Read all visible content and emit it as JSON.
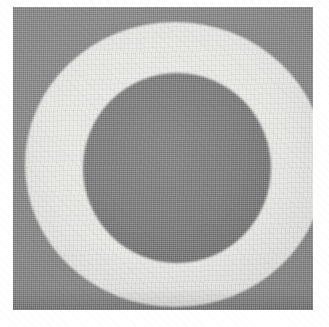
{
  "page": {
    "background_color": "#ffffff",
    "width": 329,
    "height": 327,
    "caption": ""
  },
  "image": {
    "kind": "scanned-halftone-photograph",
    "subject": "concentric-ring",
    "description": "Grayscale halftoned scan of a bright annulus (ring) surrounding a darker central disk on a mid-gray square field",
    "plate": {
      "name": "photo-plate",
      "left": 13,
      "top": 7,
      "width": 300,
      "height": 303,
      "background_color": "#8a8a8a",
      "background_label": "mid-gray field"
    },
    "shapes": [
      {
        "name": "annulus-outer",
        "role": "bright ring / outer disk",
        "color": "#e8e8e6",
        "left": 12,
        "top": 15,
        "width": 300,
        "height": 285,
        "clipped_edge": "right"
      },
      {
        "name": "disk-inner",
        "role": "dark central disk",
        "color": "#858585",
        "left": 70,
        "top": 66,
        "width": 188,
        "height": 190,
        "clipped_edge": "none"
      }
    ],
    "texture": {
      "halftone": "orthogonal dither screen, ~2px pitch",
      "grain": "horizontal scan lines with paper speckle",
      "vignette": "light falloff toward plate edges"
    },
    "tones": {
      "field_gray": "#8a8a8a",
      "ring_light": "#e8e8e6",
      "disk_gray": "#858585",
      "paper_white": "#ffffff"
    }
  }
}
